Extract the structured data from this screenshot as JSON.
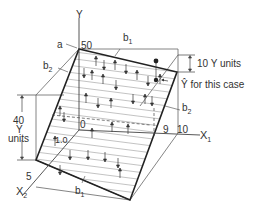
{
  "diagram": {
    "axes": {
      "y": "Y",
      "x1": "X",
      "x1_sub": "1",
      "x2": "X",
      "x2_sub": "2"
    },
    "labels": {
      "a": "a",
      "intercept": "50",
      "b1_top": "b",
      "b1_top_sub": "1",
      "b1_bottom": "b",
      "b1_bottom_sub": "1",
      "b2_left": "b",
      "b2_left_sub": "2",
      "b2_right": "b",
      "b2_right_sub": "2",
      "ten_y_units": "10 Y units",
      "yhat_case": "Ŷ for this case",
      "forty_line1": "40",
      "forty_line2": "Y",
      "forty_line3": "units",
      "origin": "0",
      "x1_9": "9",
      "x1_10": "10",
      "x2_5": "5",
      "x2_1": "1.0"
    },
    "colors": {
      "line": "#444444",
      "thick": "#222222",
      "hatch": "#999999",
      "text": "#333333"
    }
  }
}
